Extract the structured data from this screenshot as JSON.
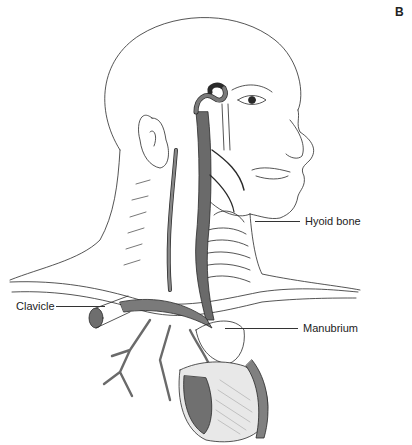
{
  "figure": {
    "panel_letter": "B",
    "labels": [
      {
        "id": "hyoid",
        "text": "Hyoid bone",
        "x": 305,
        "y": 216,
        "leader": {
          "x1": 255,
          "x2": 300,
          "y": 221
        }
      },
      {
        "id": "clavicle",
        "text": "Clavicle",
        "x": 16,
        "y": 301,
        "leader": {
          "x1": 56,
          "x2": 105,
          "y": 306
        }
      },
      {
        "id": "manubrium",
        "text": "Manubrium",
        "x": 303,
        "y": 323,
        "leader": {
          "x1": 225,
          "x2": 298,
          "y": 328
        }
      }
    ]
  },
  "colors": {
    "line": "#2a2a2a",
    "vessel_fill": "#7a7a7a",
    "vessel_dark": "#555555",
    "background": "#ffffff"
  }
}
